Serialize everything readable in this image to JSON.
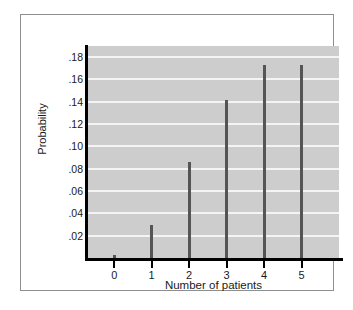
{
  "chart_data": {
    "type": "bar",
    "title": "",
    "subtitle": "",
    "xlabel": "Number of patients",
    "ylabel": "Probability",
    "categories": [
      "0",
      "1",
      "2",
      "3",
      "4",
      "5"
    ],
    "values": [
      0.003,
      0.03,
      0.086,
      0.142,
      0.173,
      0.173
    ],
    "xlim": [
      -0.7,
      6.0
    ],
    "ylim": [
      0,
      0.19
    ],
    "ytick_labels": [
      ".18",
      ".16",
      ".14",
      ".12",
      ".10",
      ".08",
      ".06",
      ".04",
      ".02"
    ],
    "ytick_values": [
      0.18,
      0.16,
      0.14,
      0.12,
      0.1,
      0.08,
      0.06,
      0.04,
      0.02
    ],
    "xtick_labels": [
      "0",
      "1",
      "2",
      "3",
      "4",
      "5"
    ],
    "xtick_values": [
      0,
      1,
      2,
      3,
      4,
      5
    ],
    "grid": true,
    "grid_axis": "y",
    "legend": false,
    "legend_position": "none",
    "colors": {
      "plot_background": "#cdcdcd",
      "gridline": "#f4f4f4",
      "bar": "#555555",
      "axis": "#000000",
      "frame": "#8e8e8e",
      "figure_background": "#ffffff",
      "text": "#1a1a1a"
    }
  }
}
